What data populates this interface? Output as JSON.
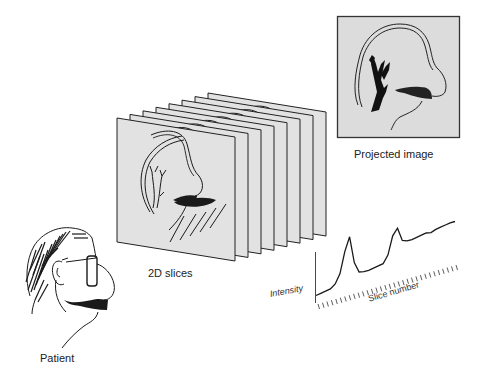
{
  "labels": {
    "projected_image": "Projected image",
    "slices": "2D slices",
    "patient": "Patient",
    "intensity_axis": "Intensity",
    "slice_axis": "Slice number"
  },
  "colors": {
    "background": "#ffffff",
    "plane_fill": "#e2e2e2",
    "line": "#1a1a1a",
    "projected_border": "#333333"
  },
  "slices": {
    "count": 8
  },
  "chart_data": {
    "type": "line",
    "title": "",
    "xlabel": "Slice number",
    "ylabel": "Intensity",
    "series": [
      {
        "name": "Intensity",
        "x": [
          1,
          2,
          3,
          4,
          5,
          6,
          7,
          8,
          9,
          10,
          11,
          12,
          13,
          14,
          15,
          16,
          17,
          18,
          19,
          20,
          21,
          22,
          23,
          24,
          25,
          26,
          27,
          28,
          29,
          30
        ],
        "values": [
          5,
          6,
          7,
          8,
          12,
          22,
          45,
          60,
          30,
          18,
          17,
          17,
          18,
          19,
          20,
          28,
          48,
          55,
          40,
          38,
          38,
          39,
          40,
          41,
          40,
          42,
          43,
          44,
          45,
          45
        ]
      }
    ],
    "grid": false,
    "legend": "none"
  }
}
